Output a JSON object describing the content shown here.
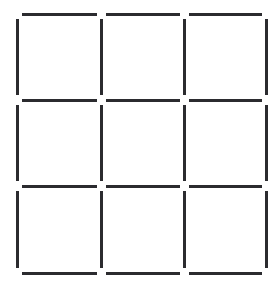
{
  "figure": {
    "kind": "matchstick-puzzle-diagram",
    "width": 277,
    "height": 283,
    "background_color": "#ffffff",
    "stick_color": "#2b2b2f",
    "stick_thickness": 3,
    "rows": 3,
    "columns": 3,
    "squares_count": 9,
    "sticks_total": 24,
    "horizontal_sticks_count": 12,
    "vertical_sticks_count": 12,
    "grid_x_lines": [
      17,
      101,
      184,
      266
    ],
    "grid_y_lines": [
      14,
      100,
      186,
      273
    ],
    "corner_gap": 5
  },
  "sticks": {
    "horizontal": [
      {
        "name": "h-r0-c0",
        "row": 0,
        "col": 0,
        "x1": 22,
        "x2": 97,
        "y": 14
      },
      {
        "name": "h-r0-c1",
        "row": 0,
        "col": 1,
        "x1": 106,
        "x2": 180,
        "y": 14
      },
      {
        "name": "h-r0-c2",
        "row": 0,
        "col": 2,
        "x1": 189,
        "x2": 262,
        "y": 14
      },
      {
        "name": "h-r1-c0",
        "row": 1,
        "col": 0,
        "x1": 22,
        "x2": 97,
        "y": 100
      },
      {
        "name": "h-r1-c1",
        "row": 1,
        "col": 1,
        "x1": 106,
        "x2": 180,
        "y": 100
      },
      {
        "name": "h-r1-c2",
        "row": 1,
        "col": 2,
        "x1": 189,
        "x2": 262,
        "y": 100
      },
      {
        "name": "h-r2-c0",
        "row": 2,
        "col": 0,
        "x1": 22,
        "x2": 97,
        "y": 186
      },
      {
        "name": "h-r2-c1",
        "row": 2,
        "col": 1,
        "x1": 106,
        "x2": 180,
        "y": 186
      },
      {
        "name": "h-r2-c2",
        "row": 2,
        "col": 2,
        "x1": 189,
        "x2": 262,
        "y": 186
      },
      {
        "name": "h-r3-c0",
        "row": 3,
        "col": 0,
        "x1": 22,
        "x2": 97,
        "y": 273
      },
      {
        "name": "h-r3-c1",
        "row": 3,
        "col": 1,
        "x1": 106,
        "x2": 180,
        "y": 273
      },
      {
        "name": "h-r3-c2",
        "row": 3,
        "col": 2,
        "x1": 189,
        "x2": 262,
        "y": 273
      }
    ],
    "vertical": [
      {
        "name": "v-c0-r0",
        "col": 0,
        "row": 0,
        "y1": 19,
        "y2": 95,
        "x": 17
      },
      {
        "name": "v-c0-r1",
        "col": 0,
        "row": 1,
        "y1": 105,
        "y2": 181,
        "x": 17
      },
      {
        "name": "v-c0-r2",
        "col": 0,
        "row": 2,
        "y1": 191,
        "y2": 268,
        "x": 17
      },
      {
        "name": "v-c1-r0",
        "col": 1,
        "row": 0,
        "y1": 19,
        "y2": 95,
        "x": 101
      },
      {
        "name": "v-c1-r1",
        "col": 1,
        "row": 1,
        "y1": 105,
        "y2": 181,
        "x": 101
      },
      {
        "name": "v-c1-r2",
        "col": 1,
        "row": 2,
        "y1": 191,
        "y2": 268,
        "x": 101
      },
      {
        "name": "v-c2-r0",
        "col": 2,
        "row": 0,
        "y1": 19,
        "y2": 95,
        "x": 184
      },
      {
        "name": "v-c2-r1",
        "col": 2,
        "row": 1,
        "y1": 105,
        "y2": 181,
        "x": 184
      },
      {
        "name": "v-c2-r2",
        "col": 2,
        "row": 2,
        "y1": 191,
        "y2": 268,
        "x": 184
      },
      {
        "name": "v-c3-r0",
        "col": 3,
        "row": 0,
        "y1": 19,
        "y2": 95,
        "x": 266
      },
      {
        "name": "v-c3-r1",
        "col": 3,
        "row": 1,
        "y1": 105,
        "y2": 181,
        "x": 266
      },
      {
        "name": "v-c3-r2",
        "col": 3,
        "row": 2,
        "y1": 191,
        "y2": 268,
        "x": 266
      }
    ]
  }
}
